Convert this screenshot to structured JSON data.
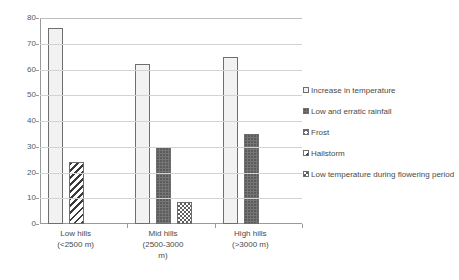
{
  "chart_data": {
    "type": "bar",
    "title": "",
    "subtitle": "",
    "xlabel": "",
    "ylabel": "",
    "ylim": [
      0,
      80
    ],
    "ytick_step": 10,
    "yticks": [
      "0",
      "10",
      "20",
      "30",
      "40",
      "50",
      "60",
      "70",
      "80"
    ],
    "grid": true,
    "legend_position": "right",
    "categories": [
      "Low hills (<2500 m)",
      "Mid hills (2500-3000 m)",
      "High hills (>3000 m)"
    ],
    "category_label_lines": [
      [
        "Low hills",
        "(<2500 m)"
      ],
      [
        "Mid hills",
        "(2500-3000",
        "m)"
      ],
      [
        "High hills",
        "(>3000 m)"
      ]
    ],
    "series": [
      {
        "name": "Increase in temperature",
        "pattern": "light-dots",
        "values": [
          76,
          62,
          65
        ]
      },
      {
        "name": "Low and erratic rainfall",
        "pattern": "solid-gray",
        "values": [
          null,
          30,
          35
        ]
      },
      {
        "name": "Frost",
        "pattern": "cross-hatch",
        "values": [
          null,
          null,
          null
        ]
      },
      {
        "name": "Hailstorm",
        "pattern": "diagonal-hatch",
        "values": [
          24,
          null,
          null
        ]
      },
      {
        "name": "Low temperature during flowering period",
        "pattern": "checkerboard",
        "values": [
          null,
          8.5,
          null
        ]
      }
    ]
  },
  "legend": {
    "items": [
      {
        "label": "Increase in temperature",
        "pattern": "light-dots"
      },
      {
        "label": "Low and erratic rainfall",
        "pattern": "solid-gray"
      },
      {
        "label": "Frost",
        "pattern": "cross-hatch"
      },
      {
        "label": "Hailstorm",
        "pattern": "diagonal-hatch"
      },
      {
        "label": "Low temperature during flowering period",
        "pattern": "checkerboard"
      }
    ]
  },
  "colors": {
    "axis": "#9a9a9a",
    "gridline": "#d3d3d3",
    "bar_outline": "#6e6e6e",
    "text": "#4a4a4a",
    "background": "#ffffff"
  }
}
